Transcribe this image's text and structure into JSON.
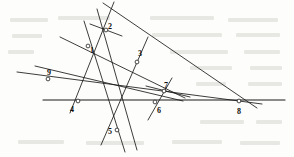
{
  "figure": {
    "width": 294,
    "height": 157,
    "background_color": "#fdfdfb",
    "ink_color": "#1a1a1a"
  },
  "chart_data": {
    "type": "diagram",
    "subtype": "point-line-configuration",
    "coordinate_space": {
      "xlim": [
        0,
        294
      ],
      "ylim": [
        0,
        157
      ],
      "y_axis": "down"
    },
    "points": [
      {
        "id": "1",
        "label": "1",
        "x": 88,
        "y": 46,
        "label_dx": 2,
        "label_dy": 5
      },
      {
        "id": "2",
        "label": "2",
        "x": 106,
        "y": 30,
        "label_dx": 2,
        "label_dy": -3
      },
      {
        "id": "3",
        "label": "3",
        "x": 137,
        "y": 62,
        "label_dx": 1,
        "label_dy": -8
      },
      {
        "id": "4",
        "label": "4",
        "x": 78,
        "y": 101,
        "label_dx": -8,
        "label_dy": 9
      },
      {
        "id": "5",
        "label": "5",
        "x": 117,
        "y": 130,
        "label_dx": -9,
        "label_dy": 2
      },
      {
        "id": "6",
        "label": "6",
        "x": 155,
        "y": 102,
        "label_dx": 2,
        "label_dy": 9
      },
      {
        "id": "7",
        "label": "7",
        "x": 164,
        "y": 91,
        "label_dx": 0,
        "label_dy": -5
      },
      {
        "id": "8",
        "label": "8",
        "x": 239,
        "y": 101,
        "label_dx": -2,
        "label_dy": 11
      },
      {
        "id": "9",
        "label": "9",
        "x": 48,
        "y": 79,
        "label_dx": -1,
        "label_dy": -6
      }
    ],
    "lines": [
      {
        "id": "L1",
        "through": [
          "9",
          "1",
          "2"
        ],
        "x1": 70,
        "y1": 113,
        "x2": 114,
        "y2": 2,
        "weight": "normal"
      },
      {
        "id": "L2",
        "through": [
          "2",
          "3",
          "8"
        ],
        "x1": 103,
        "y1": 3,
        "x2": 257,
        "y2": 108,
        "weight": "normal"
      },
      {
        "id": "L3",
        "through": [
          "9",
          "3",
          "8"
        ],
        "x1": 17,
        "y1": 72,
        "x2": 262,
        "y2": 104,
        "weight": "normal"
      },
      {
        "id": "L4",
        "through": [
          "4",
          "6",
          "8"
        ],
        "x1": 43,
        "y1": 100,
        "x2": 285,
        "y2": 100,
        "weight": "thick"
      },
      {
        "id": "L5",
        "through": [
          "1",
          "4",
          "5"
        ],
        "x1": 84,
        "y1": 21,
        "x2": 125,
        "y2": 152,
        "weight": "normal"
      },
      {
        "id": "L6",
        "through": [
          "2",
          "5",
          "6"
        ],
        "x1": 97,
        "y1": 9,
        "x2": 137,
        "y2": 150,
        "weight": "normal"
      },
      {
        "id": "L7",
        "through": [
          "1",
          "3",
          "7"
        ],
        "x1": 60,
        "y1": 37,
        "x2": 185,
        "y2": 98,
        "weight": "normal"
      },
      {
        "id": "L8",
        "through": [
          "9",
          "4",
          "7"
        ],
        "x1": 35,
        "y1": 66,
        "x2": 183,
        "y2": 101,
        "weight": "normal"
      },
      {
        "id": "L9",
        "through": [
          "5",
          "6",
          "3"
        ],
        "x1": 101,
        "y1": 145,
        "x2": 148,
        "y2": 37,
        "weight": "normal"
      },
      {
        "id": "L10",
        "through": [
          "6",
          "7",
          "3"
        ],
        "x1": 148,
        "y1": 120,
        "x2": 172,
        "y2": 78,
        "weight": "normal"
      },
      {
        "id": "L11",
        "through": [
          "7",
          "8"
        ],
        "x1": 146,
        "y1": 86,
        "x2": 190,
        "y2": 97,
        "weight": "normal"
      },
      {
        "id": "L12",
        "through": [
          "2"
        ],
        "x1": 90,
        "y1": 24,
        "x2": 122,
        "y2": 36,
        "weight": "normal"
      }
    ],
    "line_count": 9,
    "point_count": 9,
    "labels": [
      "1",
      "2",
      "3",
      "4",
      "5",
      "6",
      "7",
      "8",
      "9"
    ]
  },
  "artifacts": {
    "note": "faint reverse-side print bleed visible in background",
    "bleed_marks": [
      {
        "x": 10,
        "y": 18,
        "w": 38
      },
      {
        "x": 58,
        "y": 16,
        "w": 52
      },
      {
        "x": 150,
        "y": 16,
        "w": 64
      },
      {
        "x": 228,
        "y": 18,
        "w": 50
      },
      {
        "x": 12,
        "y": 34,
        "w": 30
      },
      {
        "x": 152,
        "y": 33,
        "w": 70
      },
      {
        "x": 236,
        "y": 33,
        "w": 44
      },
      {
        "x": 8,
        "y": 50,
        "w": 26
      },
      {
        "x": 170,
        "y": 50,
        "w": 58
      },
      {
        "x": 244,
        "y": 50,
        "w": 36
      },
      {
        "x": 190,
        "y": 66,
        "w": 42
      },
      {
        "x": 250,
        "y": 66,
        "w": 32
      },
      {
        "x": 196,
        "y": 82,
        "w": 30
      },
      {
        "x": 248,
        "y": 82,
        "w": 34
      },
      {
        "x": 200,
        "y": 120,
        "w": 44
      },
      {
        "x": 256,
        "y": 120,
        "w": 26
      },
      {
        "x": 18,
        "y": 140,
        "w": 46
      },
      {
        "x": 86,
        "y": 141,
        "w": 58
      },
      {
        "x": 172,
        "y": 140,
        "w": 50
      },
      {
        "x": 240,
        "y": 141,
        "w": 40
      }
    ]
  }
}
